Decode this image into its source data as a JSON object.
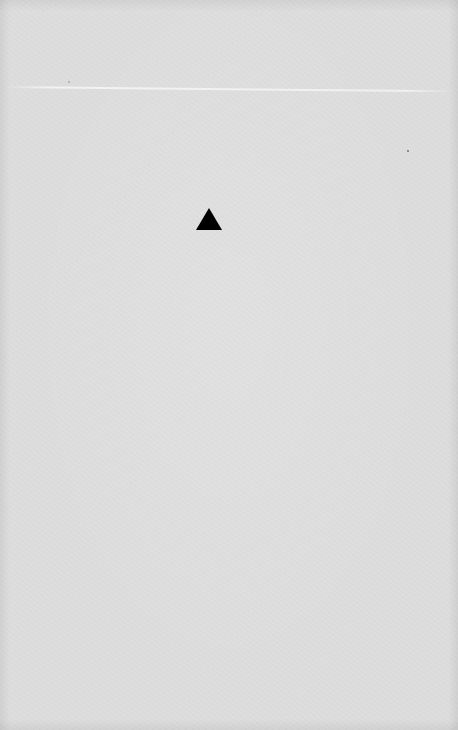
{
  "document": {
    "type": "scanned-page",
    "background_color": "#dddddd",
    "marks": [
      {
        "shape": "triangle-up",
        "icon": "triangle-up-icon",
        "color": "#000000"
      }
    ]
  }
}
